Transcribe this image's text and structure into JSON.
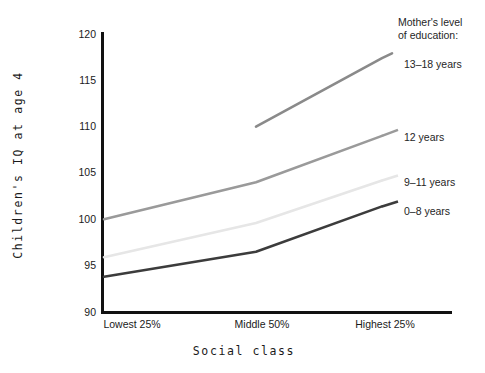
{
  "chart_data": {
    "type": "line",
    "title": "",
    "xlabel": "Social class",
    "ylabel": "Children's IQ at age 4",
    "categories": [
      "Lowest 25%",
      "Middle 50%",
      "Highest 25%"
    ],
    "ylim": [
      90,
      120
    ],
    "yticks": [
      90,
      95,
      100,
      105,
      110,
      115,
      120
    ],
    "grid": false,
    "legend_position": "right",
    "legend_title": "Mother's level of education:",
    "series": [
      {
        "name": "13–18 years",
        "color": "#8a8a8a",
        "x": [
          "Middle 50%",
          "Highest 25%"
        ],
        "values": [
          110.0,
          117.4
        ]
      },
      {
        "name": "12 years",
        "color": "#9a9a9a",
        "x": [
          "Lowest 25%",
          "Middle 50%",
          "Highest 25%"
        ],
        "values": [
          100.0,
          104.0,
          109.0
        ]
      },
      {
        "name": "9–11 years",
        "color": "#e6e6e6",
        "x": [
          "Lowest 25%",
          "Middle 50%",
          "Highest 25%"
        ],
        "values": [
          95.9,
          99.6,
          104.2
        ]
      },
      {
        "name": "0–8 years",
        "color": "#3c3c3c",
        "x": [
          "Lowest 25%",
          "Middle 50%",
          "Highest 25%"
        ],
        "values": [
          93.8,
          96.5,
          101.4
        ]
      }
    ]
  },
  "axis": {
    "y_tick_labels": [
      "120",
      "115",
      "110",
      "105",
      "100",
      "95",
      "90"
    ],
    "x_tick_labels": [
      "Lowest 25%",
      "Middle 50%",
      "Highest 25%"
    ],
    "y_title": "Children's IQ at age 4",
    "x_title": "Social class"
  },
  "legend": {
    "title_line_1": "Mother's level",
    "title_line_2": "of education:",
    "entries": [
      {
        "label": "13–18 years"
      },
      {
        "label": "12 years"
      },
      {
        "label": "9–11 years"
      },
      {
        "label": "0–8 years"
      }
    ]
  }
}
